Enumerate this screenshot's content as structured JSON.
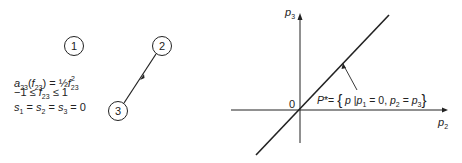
{
  "network": {
    "nodes": [
      {
        "id": "1",
        "label": "1",
        "cx": 74,
        "cy": 46
      },
      {
        "id": "2",
        "label": "2",
        "cx": 162,
        "cy": 46
      },
      {
        "id": "3",
        "label": "3",
        "cx": 118,
        "cy": 111
      }
    ],
    "arc": {
      "from": "2",
      "to": "3",
      "direction": "2→3"
    },
    "equations": {
      "cost": "a23(f23) = ½ f23²",
      "cost_lhs": "a",
      "cost_lhs_sub": "23",
      "cost_arg": "f",
      "cost_arg_sub": "23",
      "cost_rhs_frac": "½",
      "cost_rhs_var": "f",
      "cost_rhs_sub": "23",
      "cost_rhs_sup": "2",
      "bound": "−1 ≤ f23 ≤ 1",
      "bound_low": "−1 ≤",
      "bound_var": "f",
      "bound_sub": "23",
      "bound_high": "≤ 1",
      "supply": "s1 = s2 = s3 = 0"
    }
  },
  "plot": {
    "x_axis_label": "p",
    "x_axis_sub": "2",
    "y_axis_label": "p",
    "y_axis_sub": "3",
    "origin_label": "0",
    "annotation": "P* = { p | p1 = 0, p2 = p3 }",
    "line": "p2 = p3"
  }
}
